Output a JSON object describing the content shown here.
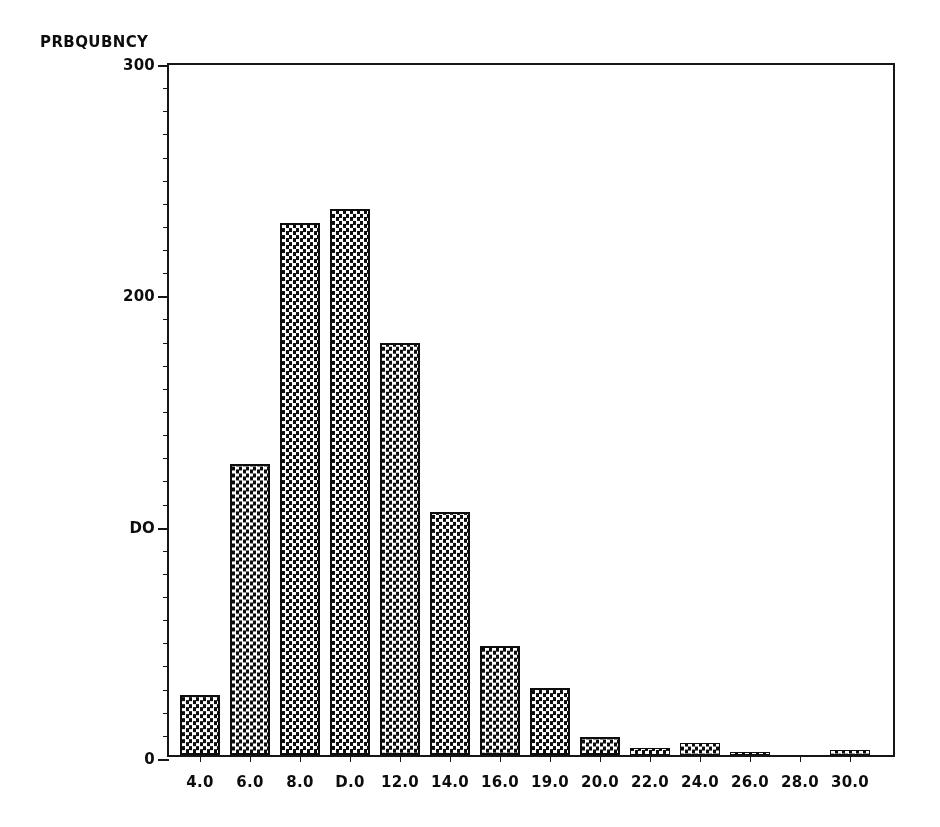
{
  "chart_data": {
    "type": "bar",
    "title": "",
    "subtitle": "",
    "xlabel": "",
    "ylabel": "PRBQUBNCY",
    "categories": [
      "4.0",
      "6.0",
      "8.0",
      "10.0",
      "12.0",
      "14.0",
      "16.0",
      "19.0",
      "20.0",
      "22.0",
      "24.0",
      "26.0",
      "28.0",
      "30.0"
    ],
    "x": [
      4.0,
      6.0,
      8.0,
      10.0,
      12.0,
      14.0,
      16.0,
      18.0,
      20.0,
      22.0,
      24.0,
      26.0,
      28.0,
      30.0
    ],
    "values": [
      26,
      126,
      230,
      236,
      178,
      105,
      47,
      29,
      8,
      3,
      5,
      1,
      0,
      2
    ],
    "ylim": [
      0,
      300
    ],
    "xlim": [
      3.0,
      31.0
    ],
    "y_ticks_major": [
      0,
      100,
      200,
      300
    ],
    "y_tick_labels": [
      "0",
      "DO",
      "200",
      "300"
    ],
    "y_ticks_minor_step": 10,
    "grid": false,
    "legend": null,
    "bar_fill": "checkerboard-halftone",
    "bar_edge_color": "#111111",
    "axis_color": "#1a1a1a",
    "background": "#ffffff"
  },
  "axes": {
    "y_title": "PRBQUBNCY",
    "y_labels": [
      {
        "value": 300,
        "text": "300"
      },
      {
        "value": 200,
        "text": "200"
      },
      {
        "value": 100,
        "text": "DO"
      },
      {
        "value": 0,
        "text": "0"
      }
    ],
    "x_labels": [
      {
        "value": 4.0,
        "text": "4.0"
      },
      {
        "value": 6.0,
        "text": "6.0"
      },
      {
        "value": 8.0,
        "text": "8.0"
      },
      {
        "value": 10.0,
        "text": "D.0"
      },
      {
        "value": 12.0,
        "text": "12.0"
      },
      {
        "value": 14.0,
        "text": "14.0"
      },
      {
        "value": 16.0,
        "text": "16.0"
      },
      {
        "value": 18.0,
        "text": "19.0"
      },
      {
        "value": 20.0,
        "text": "20.0"
      },
      {
        "value": 22.0,
        "text": "22.0"
      },
      {
        "value": 24.0,
        "text": "24.0"
      },
      {
        "value": 26.0,
        "text": "26.0"
      },
      {
        "value": 28.0,
        "text": "28.0"
      },
      {
        "value": 30.0,
        "text": "30.0"
      }
    ]
  },
  "geometry": {
    "plot_left": 167,
    "plot_top": 63,
    "plot_width": 728,
    "plot_height": 694,
    "bar_pitch": 50,
    "bar_width": 40,
    "first_bar_left": 11
  }
}
